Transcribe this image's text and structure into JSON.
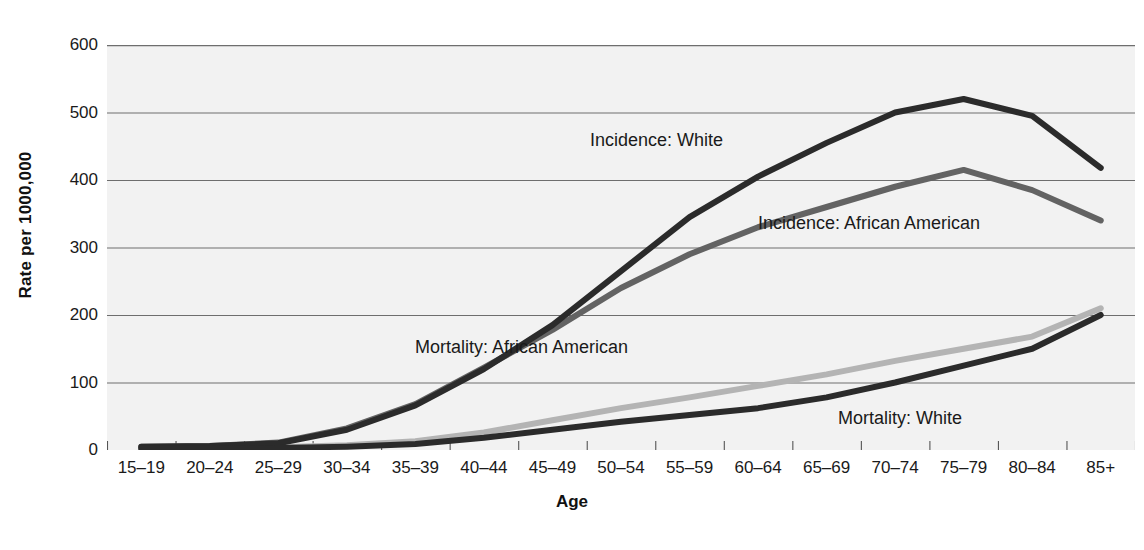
{
  "chart_data": {
    "type": "line",
    "title": "",
    "xlabel": "Age",
    "ylabel": "Rate per 1000,000",
    "ylim": [
      0,
      600
    ],
    "yticks": [
      0,
      100,
      200,
      300,
      400,
      500,
      600
    ],
    "grid": true,
    "legend_position": "inline-labels",
    "categories": [
      "15–19",
      "20–24",
      "25–29",
      "30–34",
      "35–39",
      "40–44",
      "45–49",
      "50–54",
      "55–59",
      "60–64",
      "65–69",
      "70–74",
      "75–79",
      "80–84",
      "85+"
    ],
    "series": [
      {
        "name": "Incidence: White",
        "color": "#2b2b2b",
        "values": [
          5,
          6,
          10,
          30,
          66,
          120,
          185,
          265,
          345,
          405,
          455,
          500,
          520,
          495,
          418
        ],
        "label_x": 590,
        "label_y": 130
      },
      {
        "name": "Incidence: African American",
        "color": "#636363",
        "values": [
          5,
          6,
          11,
          32,
          68,
          122,
          178,
          240,
          290,
          330,
          360,
          390,
          415,
          385,
          340
        ],
        "label_x": 758,
        "label_y": 213
      },
      {
        "name": "Mortality: African American",
        "color": "#b4b4b4",
        "values": [
          2,
          3,
          4,
          7,
          13,
          26,
          44,
          62,
          78,
          95,
          112,
          132,
          150,
          168,
          210
        ],
        "label_x": 415,
        "label_y": 337
      },
      {
        "name": "Mortality: White",
        "color": "#2b2b2b",
        "values": [
          2,
          2,
          3,
          5,
          9,
          18,
          30,
          42,
          52,
          62,
          78,
          100,
          125,
          150,
          200
        ],
        "label_x": 838,
        "label_y": 408
      }
    ]
  },
  "axes": {
    "y_title": "Rate per 1000,000",
    "x_title": "Age"
  },
  "colors": {
    "plot_background": "#f2f2f2",
    "gridline": "#6e6e6e",
    "page_background": "#ffffff",
    "text": "#1a1a1a"
  }
}
